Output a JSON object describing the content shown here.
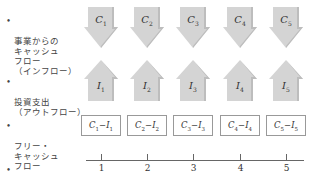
{
  "rows": {
    "inflow": {
      "bullet": "•",
      "label": "事業からの\nキャッシュ\nフロー\n（インフロー）"
    },
    "outflow": {
      "bullet": "•",
      "label": "投資支出\n（アウトフロー）"
    },
    "fcf": {
      "bullet": "•",
      "label": "フリー・\nキャッシュ\nフロー"
    },
    "time": {
      "bullet": "•",
      "label": "時点（t）"
    }
  },
  "periods": [
    {
      "t": "1",
      "inflow_sym": "C",
      "inflow_sub": "1",
      "outflow_sym": "I",
      "outflow_sub": "1",
      "fcf_a": "C",
      "fcf_a_sub": "1",
      "fcf_op": "−",
      "fcf_b": "I",
      "fcf_b_sub": "1"
    },
    {
      "t": "2",
      "inflow_sym": "C",
      "inflow_sub": "2",
      "outflow_sym": "I",
      "outflow_sub": "2",
      "fcf_a": "C",
      "fcf_a_sub": "2",
      "fcf_op": "−",
      "fcf_b": "I",
      "fcf_b_sub": "2"
    },
    {
      "t": "3",
      "inflow_sym": "C",
      "inflow_sub": "3",
      "outflow_sym": "I",
      "outflow_sub": "3",
      "fcf_a": "C",
      "fcf_a_sub": "3",
      "fcf_op": "−",
      "fcf_b": "I",
      "fcf_b_sub": "3"
    },
    {
      "t": "4",
      "inflow_sym": "C",
      "inflow_sub": "4",
      "outflow_sym": "I",
      "outflow_sub": "4",
      "fcf_a": "C",
      "fcf_a_sub": "4",
      "fcf_op": "−",
      "fcf_b": "I",
      "fcf_b_sub": "4"
    },
    {
      "t": "5",
      "inflow_sym": "C",
      "inflow_sub": "5",
      "outflow_sym": "I",
      "outflow_sub": "5",
      "fcf_a": "C",
      "fcf_a_sub": "5",
      "fcf_op": "−",
      "fcf_b": "I",
      "fcf_b_sub": "5"
    }
  ],
  "colors": {
    "arrow_fill": "#d4d4d4",
    "arrow_shadow": "#b5b5b5",
    "box_border": "#999999",
    "axis": "#666666"
  }
}
